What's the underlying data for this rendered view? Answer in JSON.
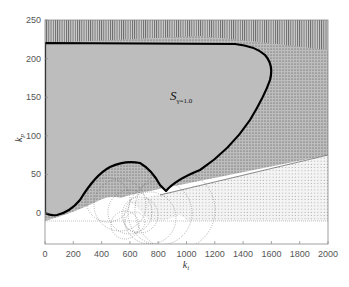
{
  "chart_data": {
    "type": "area",
    "title": "",
    "xlabel": "k_i",
    "ylabel": "k_p",
    "xlim": [
      0,
      2000
    ],
    "ylim": [
      -40,
      250
    ],
    "xticks": [
      0,
      200,
      400,
      600,
      800,
      1000,
      1200,
      1400,
      1600,
      1800,
      2000
    ],
    "yticks": [
      0,
      50,
      100,
      150,
      200,
      250
    ],
    "grid": false,
    "legend": null,
    "annotations": [
      {
        "text": "S",
        "subscript": "γ=1.0",
        "x": 1000,
        "y": 155
      }
    ],
    "series": [
      {
        "name": "stability region boundary S_γ=1.0",
        "style": "thick black line, gray filled interior",
        "x": [
          0,
          0,
          30,
          80,
          150,
          250,
          350,
          430,
          500,
          560,
          620,
          680,
          740,
          760,
          900,
          1050,
          1200,
          1350,
          1450,
          1540,
          1580,
          1590,
          1570,
          1480,
          1350,
          1100,
          800,
          400,
          0
        ],
        "y": [
          220,
          0,
          -2,
          -2,
          10,
          40,
          60,
          66,
          66,
          60,
          45,
          30,
          25,
          28,
          50,
          72,
          98,
          128,
          155,
          185,
          200,
          210,
          216,
          219,
          220,
          220,
          220,
          220,
          220
        ]
      },
      {
        "name": "lower envelope of dotted circles",
        "style": "gray shaded wedge bounded by straight line",
        "x": [
          0,
          600,
          2000
        ],
        "y": [
          -10,
          -10,
          75
        ]
      },
      {
        "name": "dotted circle family",
        "style": "dotted gray circles",
        "x": [
          400,
          500,
          600,
          700,
          800,
          1000,
          1200,
          1400,
          1600,
          1800,
          2000
        ],
        "y": [
          20,
          10,
          0,
          -5,
          -5,
          0,
          5,
          10,
          15,
          20,
          25
        ]
      }
    ]
  }
}
